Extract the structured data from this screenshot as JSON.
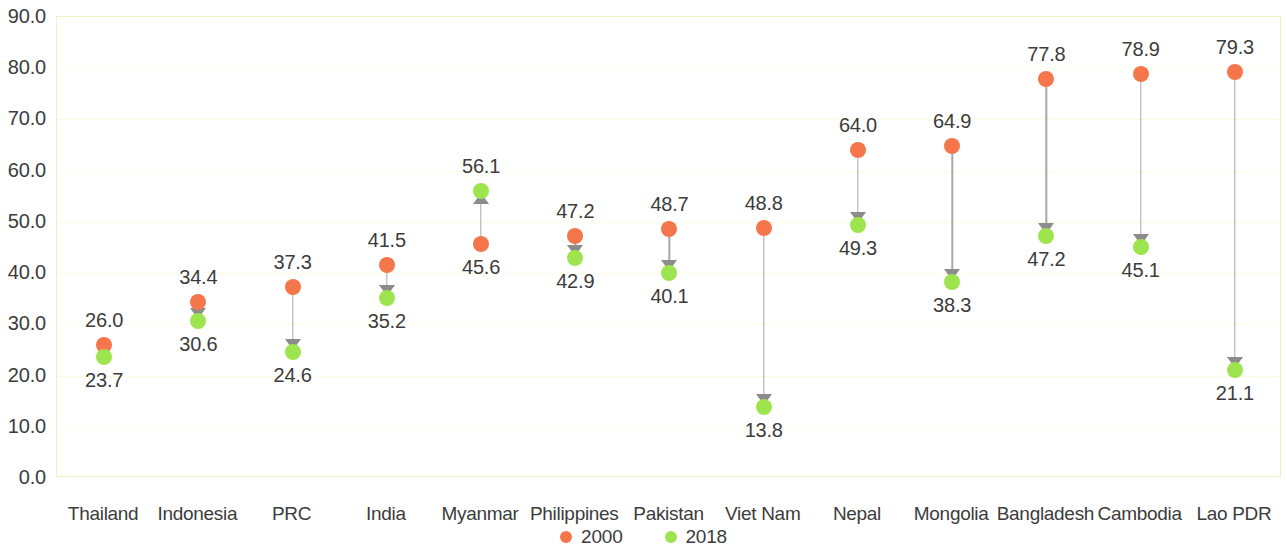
{
  "chart_data": {
    "type": "scatter",
    "title": "",
    "subtitle": "",
    "xlabel": "",
    "ylabel": "",
    "ylim": [
      0.0,
      90.0
    ],
    "y_ticks": [
      "0.0",
      "10.0",
      "20.0",
      "30.0",
      "40.0",
      "50.0",
      "60.0",
      "70.0",
      "80.0",
      "90.0"
    ],
    "y_tick_values": [
      0,
      10,
      20,
      30,
      40,
      50,
      60,
      70,
      80,
      90
    ],
    "grid": true,
    "legend_position": "bottom-center",
    "categories": [
      "Thailand",
      "Indonesia",
      "PRC",
      "India",
      "Myanmar",
      "Philippines",
      "Pakistan",
      "Viet Nam",
      "Nepal",
      "Mongolia",
      "Bangladesh",
      "Cambodia",
      "Lao PDR"
    ],
    "series": [
      {
        "name": "2000",
        "color": "#f4764a",
        "values": [
          26.0,
          34.4,
          37.3,
          41.5,
          45.6,
          47.2,
          48.7,
          48.8,
          64.0,
          64.9,
          77.8,
          78.9,
          79.3
        ],
        "labels": [
          "26.0",
          "34.4",
          "37.3",
          "41.5",
          "45.6",
          "47.2",
          "48.7",
          "48.8",
          "64.0",
          "64.9",
          "77.8",
          "78.9",
          "79.3"
        ]
      },
      {
        "name": "2018",
        "color": "#9ee44f",
        "values": [
          23.7,
          30.6,
          24.6,
          35.2,
          56.1,
          42.9,
          40.1,
          13.8,
          49.3,
          38.3,
          47.2,
          45.1,
          21.1
        ],
        "labels": [
          "23.7",
          "30.6",
          "24.6",
          "35.2",
          "56.1",
          "42.9",
          "40.1",
          "13.8",
          "49.3",
          "38.3",
          "47.2",
          "45.1",
          "21.1"
        ]
      }
    ],
    "arrow_directions": [
      "down",
      "down",
      "down",
      "down",
      "up",
      "down",
      "down",
      "down",
      "down",
      "down",
      "down",
      "down",
      "down"
    ]
  },
  "legend": {
    "items": [
      {
        "label": "2000",
        "color": "#f4764a"
      },
      {
        "label": "2018",
        "color": "#9ee44f"
      }
    ]
  },
  "colors": {
    "series_2000": "#f4764a",
    "series_2018": "#9ee44f",
    "connector": "#a8a8a8",
    "arrow": "#8c8c8c",
    "plot_border": "#e9f3c6",
    "gridline": "#fbfbe8",
    "text": "#3c3c3c",
    "background": "#ffffff"
  }
}
